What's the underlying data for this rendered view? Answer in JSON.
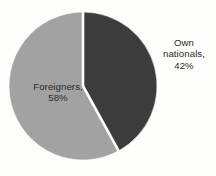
{
  "chart_data": {
    "type": "pie",
    "title": "",
    "subtitle": "",
    "xlabel": "",
    "ylabel": "",
    "legend_position": "none",
    "grid": false,
    "start_angle_deg": 0,
    "direction": "clockwise",
    "total_percent": 100,
    "categories": [
      "Own nationals",
      "Foreigners"
    ],
    "values": [
      42,
      58
    ],
    "slices": [
      {
        "name": "Own nationals",
        "value": 42,
        "unit": "%",
        "color": "#3c3c3c",
        "angle_deg": 151.2,
        "label_lines": [
          "Own",
          "nationals,",
          "42%"
        ],
        "label_position": "outside-right"
      },
      {
        "name": "Foreigners",
        "value": 58,
        "unit": "%",
        "color": "#a2a2a2",
        "angle_deg": 208.8,
        "label_lines": [
          "Foreigners,",
          "58%"
        ],
        "label_position": "inside-left"
      }
    ],
    "separator_color": "#ffffff",
    "background_color": "#fdfdfc"
  }
}
